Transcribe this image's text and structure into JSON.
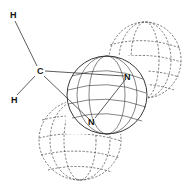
{
  "diagram": {
    "atoms": [
      {
        "id": "H1",
        "label": "H",
        "x": 13,
        "y": 17
      },
      {
        "id": "C",
        "label": "C",
        "x": 40,
        "y": 73
      },
      {
        "id": "H2",
        "label": "H",
        "x": 14,
        "y": 102
      },
      {
        "id": "N1",
        "label": "N",
        "x": 127,
        "y": 79
      },
      {
        "id": "N2",
        "label": "N",
        "x": 92,
        "y": 124
      }
    ],
    "colors": {
      "line": "#222222",
      "background": "#ffffff"
    }
  }
}
